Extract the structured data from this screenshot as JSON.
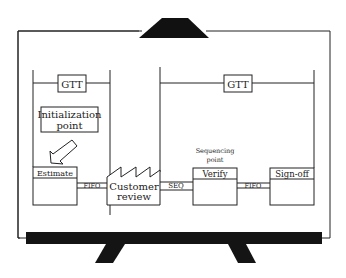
{
  "diagram": {
    "gtt_left": "GTT",
    "gtt_right": "GTT",
    "init_line1": "Initialization",
    "init_line2": "point",
    "seq_point_line1": "Sequencing",
    "seq_point_line2": "point",
    "stages": {
      "estimate": "Estimate",
      "customer_review_line1": "Customer",
      "customer_review_line2": "review",
      "verify": "Verify",
      "signoff": "Sign-off"
    },
    "connectors": {
      "c1": "FIFO",
      "c2": "SEQ",
      "c3": "FIFO"
    }
  }
}
